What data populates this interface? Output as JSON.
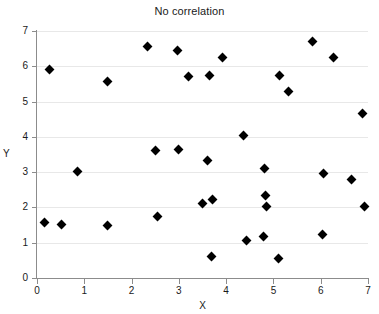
{
  "chart_data": {
    "type": "scatter",
    "title": "No correlation",
    "xlabel": "X",
    "ylabel": "Y",
    "xlim": [
      0,
      7
    ],
    "ylim": [
      0,
      7
    ],
    "xticks": [
      0,
      1,
      2,
      3,
      4,
      5,
      6,
      7
    ],
    "yticks": [
      0,
      1,
      2,
      3,
      4,
      5,
      6,
      7
    ],
    "grid": "horizontal",
    "legend": "none",
    "marker": "diamond",
    "marker_color": "#000000",
    "points": [
      {
        "x": 0.15,
        "y": 1.56
      },
      {
        "x": 0.27,
        "y": 5.91
      },
      {
        "x": 0.52,
        "y": 1.53
      },
      {
        "x": 0.85,
        "y": 3.02
      },
      {
        "x": 1.49,
        "y": 1.5
      },
      {
        "x": 1.5,
        "y": 5.56
      },
      {
        "x": 2.33,
        "y": 6.57
      },
      {
        "x": 2.51,
        "y": 3.6
      },
      {
        "x": 2.55,
        "y": 1.75
      },
      {
        "x": 2.98,
        "y": 6.46
      },
      {
        "x": 2.99,
        "y": 3.64
      },
      {
        "x": 3.21,
        "y": 5.71
      },
      {
        "x": 3.5,
        "y": 2.11
      },
      {
        "x": 3.61,
        "y": 3.33
      },
      {
        "x": 3.65,
        "y": 5.75
      },
      {
        "x": 3.69,
        "y": 0.61
      },
      {
        "x": 3.71,
        "y": 2.22
      },
      {
        "x": 3.93,
        "y": 6.25
      },
      {
        "x": 4.36,
        "y": 4.05
      },
      {
        "x": 4.44,
        "y": 1.05
      },
      {
        "x": 4.78,
        "y": 1.18
      },
      {
        "x": 4.82,
        "y": 3.1
      },
      {
        "x": 4.84,
        "y": 2.35
      },
      {
        "x": 4.85,
        "y": 2.03
      },
      {
        "x": 5.1,
        "y": 0.56
      },
      {
        "x": 5.12,
        "y": 5.74
      },
      {
        "x": 5.31,
        "y": 5.28
      },
      {
        "x": 5.82,
        "y": 6.71
      },
      {
        "x": 6.03,
        "y": 1.22
      },
      {
        "x": 6.05,
        "y": 2.97
      },
      {
        "x": 6.26,
        "y": 6.25
      },
      {
        "x": 6.66,
        "y": 2.78
      },
      {
        "x": 6.88,
        "y": 4.67
      },
      {
        "x": 6.92,
        "y": 2.02
      }
    ]
  }
}
